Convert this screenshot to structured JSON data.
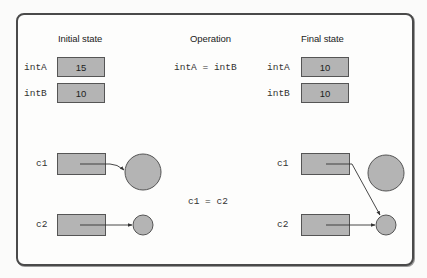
{
  "headings": {
    "initial": "Initial state",
    "operation": "Operation",
    "final": "Final state"
  },
  "primitives": {
    "initial": [
      {
        "name": "intA",
        "value": "15"
      },
      {
        "name": "intB",
        "value": "10"
      }
    ],
    "operation": "intA = intB",
    "final": [
      {
        "name": "intA",
        "value": "10"
      },
      {
        "name": "intB",
        "value": "10"
      }
    ]
  },
  "references": {
    "initial": [
      {
        "name": "c1",
        "points_to": "large object"
      },
      {
        "name": "c2",
        "points_to": "small object"
      }
    ],
    "operation": "c1 = c2",
    "final": [
      {
        "name": "c1",
        "points_to": "small object"
      },
      {
        "name": "c2",
        "points_to": "small object"
      }
    ]
  },
  "colors": {
    "box_fill": "#b4b4b4",
    "stroke": "#555555",
    "frame": "#4a4a4a"
  }
}
